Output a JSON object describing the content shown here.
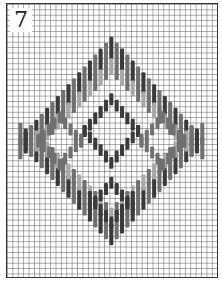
{
  "figure": {
    "label": "7",
    "grid": {
      "cell_px": 5.4,
      "columns": 39,
      "rows": 51,
      "line_color": "#5a5a5a"
    },
    "colors": {
      "dark": "#3a3a3a",
      "mid": "#707070",
      "light": "#a8a8a8",
      "frame": "#333333",
      "background": "#ffffff"
    }
  }
}
